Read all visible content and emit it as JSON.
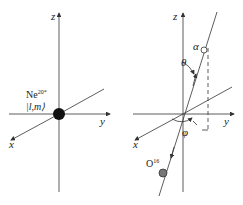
{
  "left_panel": {
    "axes": {
      "z": "z",
      "y": "y",
      "x": "x"
    },
    "nucleus": {
      "symbol": "Ne",
      "superscript": "20*",
      "state": "|l,m⟩"
    }
  },
  "right_panel": {
    "axes": {
      "z": "z",
      "y": "y",
      "x": "x"
    },
    "alpha_label": "α",
    "theta_label": "θ",
    "phi_label": "φ",
    "oxygen": {
      "symbol": "O",
      "superscript": "16"
    }
  },
  "colors": {
    "line": "#333333",
    "particle_fill": "#111111",
    "oxygen_fill": "#777777"
  }
}
